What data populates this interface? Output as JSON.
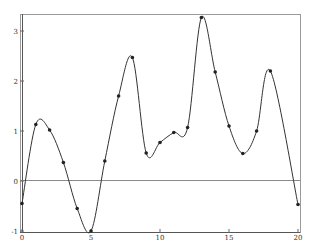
{
  "chart_data": {
    "type": "line",
    "title": "",
    "xlabel": "",
    "ylabel": "",
    "xlim": [
      0,
      20
    ],
    "ylim": [
      -1,
      3.3
    ],
    "grid": false,
    "legend": null,
    "x_ticks": [
      "0",
      "5",
      "10",
      "15",
      "20"
    ],
    "y_ticks": [
      "-1",
      "0",
      "1",
      "2",
      "3"
    ],
    "reference_lines": [
      {
        "axis": "y",
        "value": 0
      }
    ],
    "series": [
      {
        "name": "interpolating spline",
        "style": "smooth curve with markers",
        "x": [
          0,
          1,
          2,
          3,
          4,
          5,
          6,
          7,
          8,
          9,
          10,
          11,
          12,
          13,
          14,
          15,
          16,
          17,
          18,
          20
        ],
        "values": [
          -0.45,
          1.13,
          1.02,
          0.37,
          -0.55,
          -1.0,
          0.4,
          1.7,
          2.47,
          0.56,
          0.77,
          0.97,
          1.07,
          3.27,
          2.18,
          1.1,
          0.55,
          1.0,
          2.2,
          -0.47
        ]
      }
    ]
  },
  "colors": {
    "curve": "#333333",
    "markers": "#222222",
    "frame": "#9a9a9a"
  }
}
